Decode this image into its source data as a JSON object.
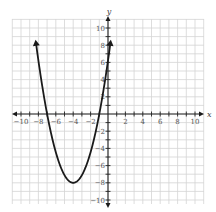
{
  "chart_data": {
    "type": "line",
    "title": "",
    "xlabel": "x",
    "ylabel": "y",
    "xlim": [
      -10,
      10
    ],
    "ylim": [
      -10,
      10
    ],
    "grid": true,
    "legend": null,
    "x_tick_labels": [
      "-10",
      "-8",
      "-6",
      "-4",
      "-2",
      "2",
      "4",
      "6",
      "8",
      "10"
    ],
    "y_tick_labels": [
      "10",
      "8",
      "6",
      "4",
      "2",
      "-2",
      "-4",
      "-6",
      "-8",
      "-10"
    ],
    "series": [
      {
        "name": "parabola",
        "description": "Upward-opening parabola with vertex at (-4, -8), x-intercepts near -7 and -1, arrows at both ends",
        "vertex": [
          -4,
          -8
        ],
        "x_intercepts": [
          -7,
          -1
        ],
        "y_intercept": 6.2,
        "equation_estimate": "y = (8/9)(x + 4)^2 - 8",
        "x": [
          -8.3,
          -8,
          -7,
          -6,
          -5,
          -4,
          -3,
          -2,
          -1,
          0,
          0.3
        ],
        "y": [
          8.4,
          6.2,
          0,
          -4.4,
          -7.1,
          -8,
          -7.1,
          -4.4,
          0,
          6.2,
          8.4
        ]
      }
    ]
  },
  "axes": {
    "x_title": "x",
    "y_title": "y"
  },
  "colors": {
    "grid": "#d4d4d4",
    "axis": "#222222",
    "curve": "#1a1a1a",
    "labels": "#555555"
  }
}
